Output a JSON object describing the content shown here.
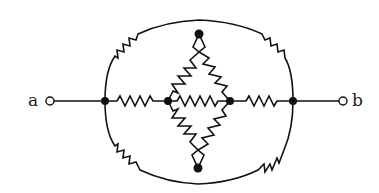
{
  "diagram": {
    "type": "resistor network",
    "terminals": [
      {
        "id": "a",
        "label": "a",
        "x": 50,
        "y": 101
      },
      {
        "id": "b",
        "label": "b",
        "x": 343,
        "y": 101
      }
    ],
    "nodes": [
      {
        "id": "L",
        "x": 105,
        "y": 101
      },
      {
        "id": "CL",
        "x": 168,
        "y": 101
      },
      {
        "id": "CR",
        "x": 230,
        "y": 101
      },
      {
        "id": "R",
        "x": 293,
        "y": 101
      },
      {
        "id": "T",
        "x": 199,
        "y": 34
      },
      {
        "id": "B",
        "x": 198,
        "y": 168
      }
    ],
    "resistors": [
      {
        "from": "L",
        "to": "CL",
        "placement": "horizontal"
      },
      {
        "from": "CL",
        "to": "CR",
        "placement": "horizontal"
      },
      {
        "from": "CR",
        "to": "R",
        "placement": "horizontal"
      },
      {
        "from": "CL",
        "to": "T",
        "placement": "diagonal"
      },
      {
        "from": "T",
        "to": "CR",
        "placement": "diagonal"
      },
      {
        "from": "CL",
        "to": "B",
        "placement": "diagonal"
      },
      {
        "from": "B",
        "to": "CR",
        "placement": "diagonal"
      },
      {
        "from": "L",
        "to": "R",
        "placement": "outer arc top-left"
      },
      {
        "from": "L",
        "to": "R",
        "placement": "outer arc top-right"
      },
      {
        "from": "L",
        "to": "R",
        "placement": "outer arc bottom-left"
      },
      {
        "from": "L",
        "to": "R",
        "placement": "outer arc bottom-right"
      }
    ],
    "colors": {
      "stroke": "#111111",
      "background": "#ffffff"
    }
  }
}
